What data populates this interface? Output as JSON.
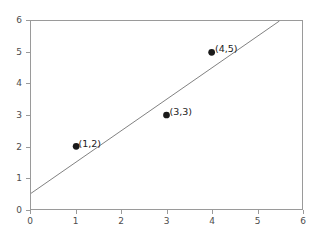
{
  "chart_data": {
    "type": "scatter",
    "title": "",
    "subtitle": "",
    "xlabel": "",
    "ylabel": "",
    "xlim": [
      0,
      6
    ],
    "ylim": [
      0,
      6
    ],
    "xticks": [
      0,
      1,
      2,
      3,
      4,
      5,
      6
    ],
    "yticks": [
      0,
      1,
      2,
      3,
      4,
      5,
      6
    ],
    "xtick_labels": [
      "0",
      "1",
      "2",
      "3",
      "4",
      "5",
      "6"
    ],
    "ytick_labels": [
      "0",
      "1",
      "2",
      "3",
      "4",
      "5",
      "6"
    ],
    "grid": false,
    "legend": null,
    "legend_position": "none",
    "points": [
      {
        "x": 1,
        "y": 2,
        "label": "(1,2)"
      },
      {
        "x": 3,
        "y": 3,
        "label": "(3,3)"
      },
      {
        "x": 4,
        "y": 5,
        "label": "(4,5)"
      }
    ],
    "series": [
      {
        "name": "data-points",
        "type": "scatter",
        "marker": "circle",
        "color": "#1a1a1a",
        "x": [
          1,
          3,
          4
        ],
        "y": [
          2,
          3,
          5
        ]
      },
      {
        "name": "fit-line",
        "type": "line",
        "color": "#808080",
        "intercept": 0.5,
        "slope": 1.0,
        "x": [
          0,
          5.5
        ],
        "y": [
          0.5,
          6.0
        ]
      }
    ],
    "axes_color": "#9a9a9a",
    "tick_label_color": "#4d4d4d",
    "background_color": "#ffffff"
  }
}
